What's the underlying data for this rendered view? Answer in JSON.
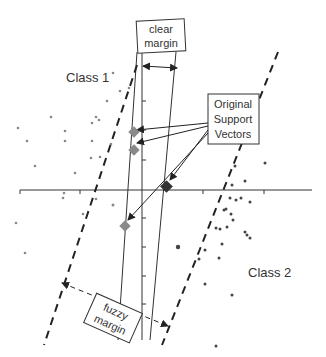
{
  "labels": {
    "class1": "Class 1",
    "class2": "Class 2",
    "clear_margin_line1": "clear",
    "clear_margin_line2": "margin",
    "support_vectors_line1": "Original",
    "support_vectors_line2": "Support",
    "support_vectors_line3": "Vectors",
    "fuzzy_margin_line1": "fuzzy",
    "fuzzy_margin_line2": "margin"
  },
  "colors": {
    "line": "#222222",
    "class1_point": "#888888",
    "class2_point": "#444444",
    "support_vector_light": "#8a8a8a",
    "support_vector_dark": "#333333"
  }
}
